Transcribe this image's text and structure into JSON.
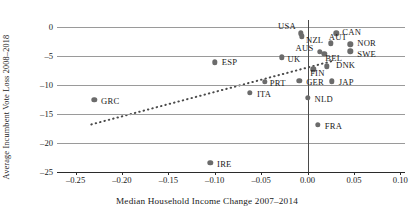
{
  "chart_data": {
    "type": "scatter",
    "title": "",
    "xlabel": "Median Household Income Change 2007–2014",
    "ylabel": "Average Incumbent Vote Loss 2008–2018",
    "xlim": [
      -0.27,
      0.105
    ],
    "ylim": [
      -25,
      1.2
    ],
    "xticks": [
      -0.25,
      -0.2,
      -0.15,
      -0.1,
      -0.05,
      0.0,
      0.05,
      0.1
    ],
    "xticklabels": [
      "–0.25",
      "–0.20",
      "–0.15",
      "–0.10",
      "–0.05",
      "0.00",
      "0.05",
      "0.10"
    ],
    "yticks": [
      0,
      -5,
      -10,
      -15,
      -20,
      -25
    ],
    "yticklabels": [
      "0",
      "–5",
      "–10",
      "–15",
      "–20",
      "–25"
    ],
    "grid": "horizontal",
    "legend": "none",
    "marker_color": "#6b6b6b",
    "gridline_color": "#9a9a9a",
    "axis_color": "#2b2b2b",
    "vertical_reference_line": 0.0,
    "points": [
      {
        "label": "USA",
        "x": -0.007,
        "y": -1.1,
        "label_dx": -23,
        "label_dy": -7
      },
      {
        "label": "NZL",
        "x": -0.006,
        "y": -1.6,
        "label_dx": 4,
        "label_dy": 4
      },
      {
        "label": "CAN",
        "x": 0.031,
        "y": -1.1,
        "label_dx": 6,
        "label_dy": -1
      },
      {
        "label": "AUT",
        "x": 0.025,
        "y": -2.8,
        "label_dx": -2,
        "label_dy": -6
      },
      {
        "label": "NOR",
        "x": 0.046,
        "y": -3.0,
        "label_dx": 7,
        "label_dy": -1
      },
      {
        "label": "SWE",
        "x": 0.046,
        "y": -4.2,
        "label_dx": 7,
        "label_dy": 3
      },
      {
        "label": "AUS",
        "x": 0.013,
        "y": -4.3,
        "label_dx": -24,
        "label_dy": -4
      },
      {
        "label": "BEL",
        "x": 0.018,
        "y": -4.6,
        "label_dx": 1,
        "label_dy": 4
      },
      {
        "label": "UK",
        "x": -0.028,
        "y": -5.2,
        "label_dx": 6,
        "label_dy": 2
      },
      {
        "label": "ESP",
        "x": -0.1,
        "y": -6.1,
        "label_dx": 7,
        "label_dy": 0
      },
      {
        "label": "DNK",
        "x": 0.021,
        "y": -6.8,
        "label_dx": 9,
        "label_dy": -1
      },
      {
        "label": "FIN",
        "x": 0.006,
        "y": -7.3,
        "label_dx": -3,
        "label_dy": 4
      },
      {
        "label": "PRT",
        "x": -0.046,
        "y": -9.5,
        "label_dx": 5,
        "label_dy": 1
      },
      {
        "label": "GER",
        "x": -0.009,
        "y": -9.3,
        "label_dx": 7,
        "label_dy": 1
      },
      {
        "label": "JAP",
        "x": 0.026,
        "y": -9.4,
        "label_dx": 7,
        "label_dy": 1
      },
      {
        "label": "ITA",
        "x": -0.062,
        "y": -11.3,
        "label_dx": 7,
        "label_dy": 1
      },
      {
        "label": "NLD",
        "x": 0.0,
        "y": -12.2,
        "label_dx": 7,
        "label_dy": 1
      },
      {
        "label": "GRC",
        "x": -0.23,
        "y": -12.6,
        "label_dx": 7,
        "label_dy": 1
      },
      {
        "label": "FRA",
        "x": 0.011,
        "y": -16.9,
        "label_dx": 7,
        "label_dy": 1
      },
      {
        "label": "IRE",
        "x": -0.105,
        "y": -23.4,
        "label_dx": 7,
        "label_dy": 1
      }
    ],
    "trendline": {
      "style": "dotted",
      "color": "#4a4a4a",
      "x_start": -0.233,
      "y_start": -16.8,
      "x_end": 0.026,
      "y_end": -5.9
    }
  }
}
